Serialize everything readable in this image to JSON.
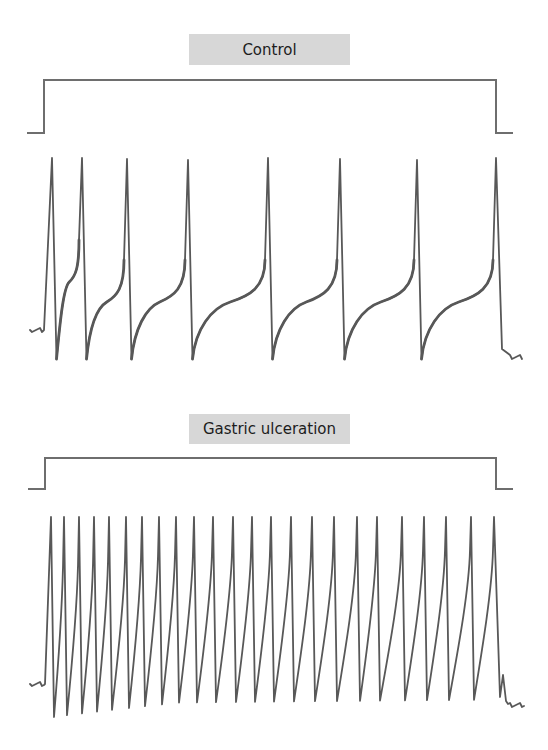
{
  "panels": [
    {
      "id": "control",
      "label": "Control",
      "stimulus": {
        "x_start": 27,
        "x_on": 44,
        "x_off": 496,
        "x_end": 513,
        "y_low": 133,
        "y_high": 80
      },
      "trace": {
        "baseline_y": 330,
        "baseline_x_start": 30,
        "baseline_x_end": 43,
        "peak_y": 158,
        "trough_y": 359,
        "spike_x": [
          52,
          82,
          127,
          188,
          268,
          340,
          417,
          496
        ],
        "end_x": 523,
        "end_y": 357,
        "shape": "slow-recovery"
      }
    },
    {
      "id": "gastric",
      "label": "Gastric ulceration",
      "stimulus": {
        "x_start": 28,
        "x_on": 45,
        "x_off": 496,
        "x_end": 513,
        "y_low": 489,
        "y_high": 458
      },
      "trace": {
        "baseline_y": 684,
        "baseline_x_start": 30,
        "baseline_x_end": 44,
        "peak_y": 517,
        "trough_y": 705,
        "spike_x": [
          51,
          64,
          79,
          94,
          109,
          126,
          142,
          159,
          176,
          194,
          213,
          233,
          252,
          271,
          291,
          312,
          334,
          357,
          377,
          402,
          424,
          446,
          471,
          494
        ],
        "end_x": 524,
        "end_y": 705,
        "shape": "fast"
      }
    }
  ],
  "chart_data": [
    {
      "type": "line",
      "title": "Control",
      "description": "Membrane potential trace during a depolarizing current step (stimulus shown above). Regular spiking with long interspike intervals and adaptation.",
      "xlabel": "",
      "ylabel": "",
      "grid": false,
      "spike_count": 8,
      "spike_times_px": [
        52,
        82,
        127,
        188,
        268,
        340,
        417,
        496
      ],
      "interspike_intervals_px": [
        30,
        45,
        61,
        80,
        72,
        77,
        79
      ]
    },
    {
      "type": "line",
      "title": "Gastric ulceration",
      "description": "Membrane potential trace during the same depolarizing current step. High-frequency repetitive firing.",
      "xlabel": "",
      "ylabel": "",
      "grid": false,
      "spike_count": 24,
      "spike_times_px": [
        51,
        64,
        79,
        94,
        109,
        126,
        142,
        159,
        176,
        194,
        213,
        233,
        252,
        271,
        291,
        312,
        334,
        357,
        377,
        402,
        424,
        446,
        471,
        494
      ]
    }
  ]
}
